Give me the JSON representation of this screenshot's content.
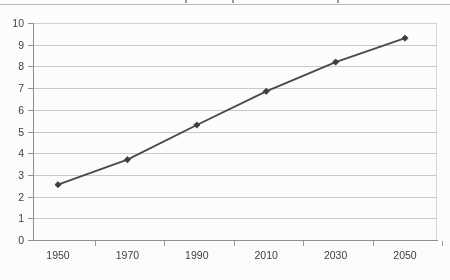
{
  "page": {
    "background_color": "#fdfdfc",
    "top_caption_rule": true
  },
  "chart_data": {
    "type": "line",
    "title": "",
    "subtitle": "",
    "xlabel": "",
    "ylabel": "",
    "categories": [
      "1950",
      "1970",
      "1990",
      "2010",
      "2030",
      "2050"
    ],
    "x": [
      1950,
      1970,
      1990,
      2010,
      2030,
      2050
    ],
    "values": [
      2.55,
      3.7,
      5.3,
      6.85,
      8.2,
      9.3
    ],
    "series": [
      {
        "name": "",
        "values": [
          2.55,
          3.7,
          5.3,
          6.85,
          8.2,
          9.3
        ]
      }
    ],
    "ylim": [
      0,
      10
    ],
    "ytick_step": 1,
    "yticks": [
      0,
      1,
      2,
      3,
      4,
      5,
      6,
      7,
      8,
      9,
      10
    ],
    "ytick_labels": [
      "0",
      "1",
      "2",
      "3",
      "4",
      "5",
      "6",
      "7",
      "8",
      "9",
      "10"
    ],
    "xtick_labels": [
      "1950",
      "1970",
      "1990",
      "2010",
      "2030",
      "2050"
    ],
    "grid": true,
    "grid_axis": "y",
    "legend": false,
    "legend_position": "none",
    "marker": "diamond",
    "line_color": "#4a4a4a",
    "marker_color": "#3d3d3d",
    "grid_color": "#c9c9c9",
    "axis_color": "#8f8f8f",
    "plot_background": "#ffffff",
    "annotations": []
  }
}
